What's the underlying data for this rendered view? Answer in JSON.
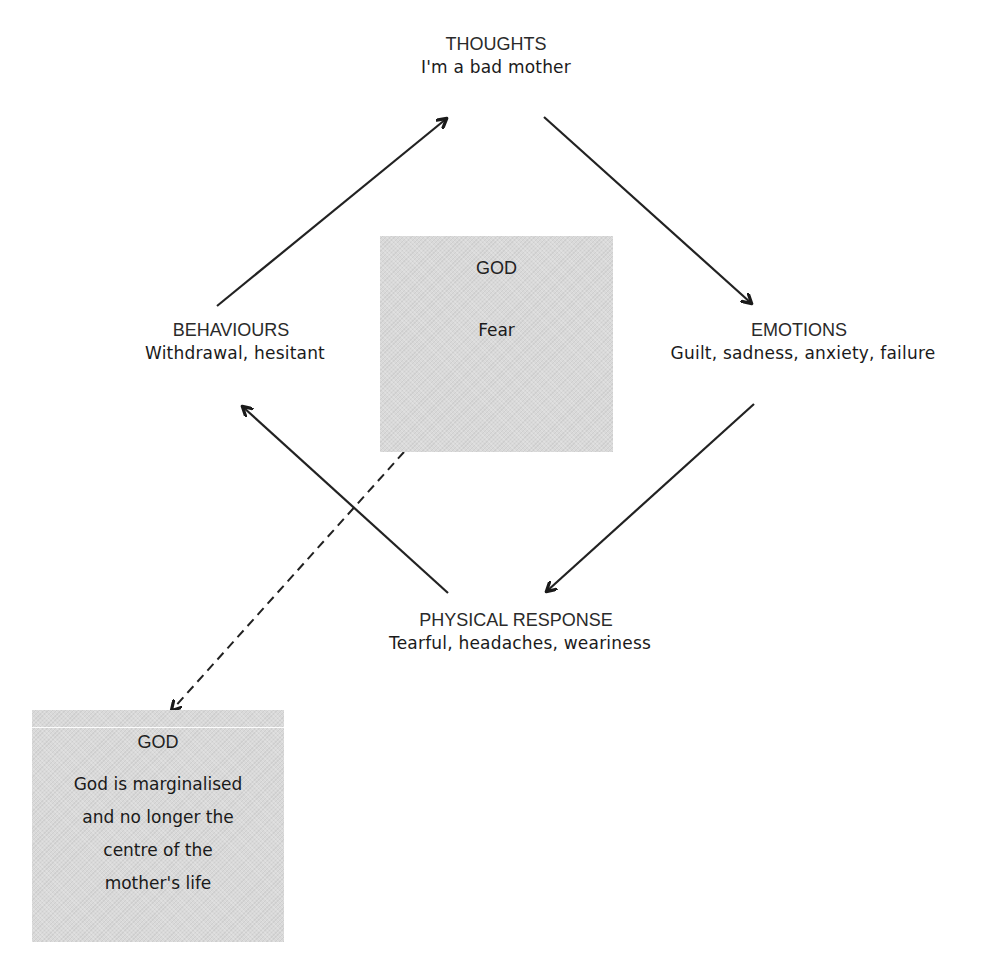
{
  "diagram": {
    "type": "cbt-cycle",
    "nodes": {
      "thoughts": {
        "title": "THOUGHTS",
        "description": "I'm a bad mother"
      },
      "emotions": {
        "title": "EMOTIONS",
        "description": "Guilt, sadness, anxiety, failure"
      },
      "physical": {
        "title": "PHYSICAL RESPONSE",
        "description": "Tearful, headaches, weariness"
      },
      "behaviours": {
        "title": "BEHAVIOURS",
        "description": "Withdrawal, hesitant"
      }
    },
    "center_box": {
      "title": "GOD",
      "body": "Fear"
    },
    "outcome_box": {
      "title": "GOD",
      "lines": [
        "God is marginalised",
        "and no longer the",
        "centre of the",
        "mother's life"
      ]
    },
    "edges": [
      {
        "from": "thoughts",
        "to": "emotions",
        "style": "solid"
      },
      {
        "from": "emotions",
        "to": "physical",
        "style": "solid"
      },
      {
        "from": "physical",
        "to": "behaviours",
        "style": "solid"
      },
      {
        "from": "behaviours",
        "to": "thoughts",
        "style": "solid"
      },
      {
        "from": "center_box",
        "to": "outcome_box",
        "style": "dashed"
      }
    ],
    "colors": {
      "box_fill": "#d9d9d9",
      "line": "#222222",
      "text": "#1a1a1a"
    }
  }
}
